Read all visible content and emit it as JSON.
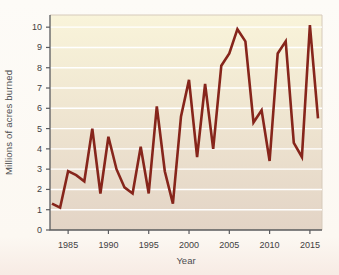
{
  "chart_data": {
    "type": "line",
    "title": "",
    "xlabel": "Year",
    "ylabel": "Millions of acres burned",
    "x_ticks": [
      1985,
      1990,
      1995,
      2000,
      2005,
      2010,
      2015
    ],
    "y_ticks": [
      0,
      1,
      2,
      3,
      4,
      5,
      6,
      7,
      8,
      9,
      10
    ],
    "xlim": [
      1982.75,
      2016.5
    ],
    "ylim": [
      0,
      10.6
    ],
    "grid": "horizontal-white-lines",
    "legend_position": "none",
    "x": [
      1983,
      1984,
      1985,
      1986,
      1987,
      1988,
      1989,
      1990,
      1991,
      1992,
      1993,
      1994,
      1995,
      1996,
      1997,
      1998,
      1999,
      2000,
      2001,
      2002,
      2003,
      2004,
      2005,
      2006,
      2007,
      2008,
      2009,
      2010,
      2011,
      2012,
      2013,
      2014,
      2015,
      2016
    ],
    "series": [
      {
        "name": "Acres burned (millions)",
        "values": [
          1.3,
          1.1,
          2.9,
          2.7,
          2.4,
          5.0,
          1.8,
          4.6,
          3.0,
          2.1,
          1.8,
          4.1,
          1.8,
          6.1,
          2.9,
          1.3,
          5.6,
          7.4,
          3.6,
          7.2,
          4.0,
          8.1,
          8.7,
          9.9,
          9.3,
          5.3,
          5.9,
          3.4,
          8.7,
          9.3,
          4.3,
          3.6,
          10.1,
          5.5
        ]
      }
    ],
    "colors": {
      "line": "#86251b",
      "plot_bg_top": "#f9f4da",
      "plot_bg_bottom": "#e3d4c6",
      "gridline": "#ffffff",
      "axis": "#5a5b5e",
      "plot_border": "#d6cabb",
      "tick_text": "#414042",
      "page_bg": "#fdfaf5"
    }
  }
}
